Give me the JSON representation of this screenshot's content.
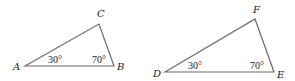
{
  "diagram": {
    "type": "similar-triangles",
    "triangles": [
      {
        "name": "ABC",
        "vertices": [
          {
            "label": "A",
            "angle": "30°"
          },
          {
            "label": "B",
            "angle": "70°"
          },
          {
            "label": "C",
            "angle": ""
          }
        ]
      },
      {
        "name": "DEF",
        "vertices": [
          {
            "label": "D",
            "angle": "30°"
          },
          {
            "label": "E",
            "angle": "70°"
          },
          {
            "label": "F",
            "angle": ""
          }
        ]
      }
    ]
  }
}
